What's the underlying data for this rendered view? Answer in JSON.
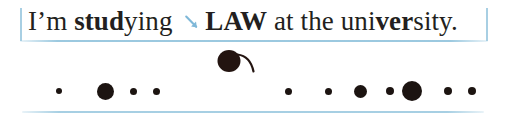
{
  "page": {
    "width": 506,
    "height": 122,
    "background_color": "#ffffff"
  },
  "sentence": {
    "full_text": "I'm studying LAW at the university.",
    "segments": [
      {
        "text": "I’m ",
        "bold": false
      },
      {
        "text": "stud",
        "bold": true
      },
      {
        "text": "ying ",
        "bold": false
      },
      {
        "text": "LAW",
        "bold": true
      },
      {
        "text": " at the uni",
        "bold": false
      },
      {
        "text": "ver",
        "bold": true
      },
      {
        "text": "sity.",
        "bold": false
      }
    ],
    "text_color": "#231f20",
    "font_size_px": 27
  },
  "annotations": {
    "arrow": {
      "icon": "diagonal-arrow-down-right-icon",
      "color": "#7fb8d8",
      "points_to": "LAW"
    },
    "bracket_left": {
      "icon": "vertical-bar-icon",
      "color": "#a8cfe3"
    },
    "bracket_right": {
      "icon": "vertical-bar-icon",
      "color": "#a8cfe3"
    },
    "rule_top": {
      "icon": "horizontal-rule-icon",
      "color": "#96c6de"
    },
    "rule_bottom": {
      "icon": "horizontal-rule-icon",
      "color": "#9dcae0"
    },
    "ink_mark": {
      "icon": "ink-blob-with-tail-icon",
      "color": "#231410",
      "description": "filled circle with curved tail sweeping up-right"
    }
  },
  "chart_data": {
    "type": "scatter",
    "title": "",
    "xlabel": "",
    "ylabel": "",
    "grid": false,
    "legend": "none",
    "xlim": [
      0,
      506
    ],
    "ylim": [
      0,
      122
    ],
    "marker_color": "#1c1411",
    "series": [
      {
        "name": "stress-dots-left-group",
        "points": [
          {
            "x": 59,
            "y": 91,
            "size": 6
          },
          {
            "x": 105,
            "y": 91,
            "size": 17
          },
          {
            "x": 133,
            "y": 91,
            "size": 7
          },
          {
            "x": 156,
            "y": 91,
            "size": 7
          }
        ]
      },
      {
        "name": "stress-dots-right-group",
        "points": [
          {
            "x": 288,
            "y": 91,
            "size": 7
          },
          {
            "x": 328,
            "y": 91,
            "size": 7
          },
          {
            "x": 360,
            "y": 91,
            "size": 13
          },
          {
            "x": 390,
            "y": 91,
            "size": 8
          },
          {
            "x": 412,
            "y": 91,
            "size": 20
          },
          {
            "x": 448,
            "y": 91,
            "size": 8
          },
          {
            "x": 472,
            "y": 91,
            "size": 8
          }
        ]
      },
      {
        "name": "ink-mark-blob",
        "points": [
          {
            "x": 232,
            "y": 60,
            "size": 22
          }
        ]
      }
    ]
  }
}
